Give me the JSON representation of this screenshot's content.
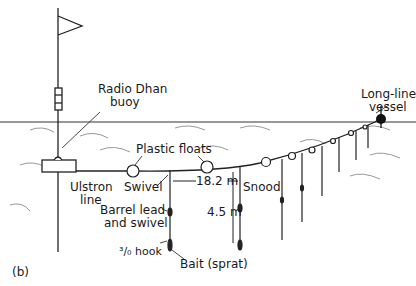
{
  "figure": {
    "panel_label": "(b)",
    "labels": {
      "radio_buoy_line1": "Radio Dhan",
      "radio_buoy_line2": "buoy",
      "vessel_line1": "Long-line",
      "vessel_line2": "vessel",
      "plastic_floats": "Plastic floats",
      "ulstron_line1": "Ulstron",
      "ulstron_line2": "line",
      "swivel": "Swivel",
      "spacing": "18.2 m",
      "snood": "Snood",
      "barrel_line1": "Barrel lead",
      "barrel_line2": "and swivel",
      "depth": "4.5 m",
      "hook": "³/₀ hook",
      "bait": "Bait (sprat)"
    },
    "colors": {
      "ink": "#1a1a1a",
      "water_wave": "#888888",
      "background": "#ffffff"
    }
  }
}
